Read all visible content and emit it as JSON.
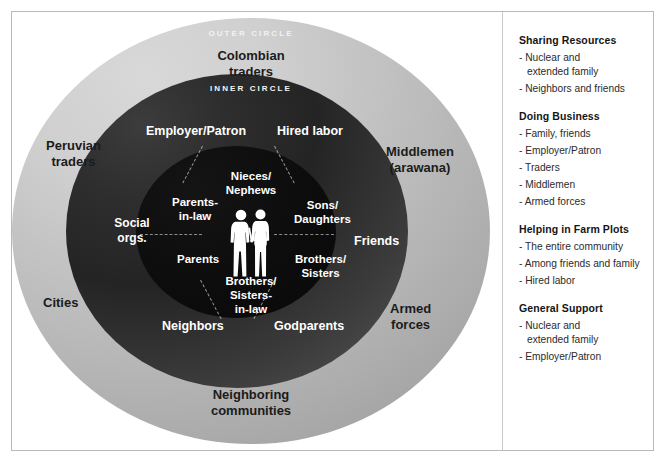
{
  "diagram": {
    "band_captions": {
      "outer": "OUTER CIRCLE",
      "inner": "INNER CIRCLE"
    },
    "outer_ring_labels": [
      {
        "id": "colombian-traders",
        "text": "Colombian\ntraders"
      },
      {
        "id": "peruvian-traders",
        "text": "Peruvian\ntraders"
      },
      {
        "id": "middlemen",
        "text": "Middlemen\n(arawana)"
      },
      {
        "id": "cities",
        "text": "Cities"
      },
      {
        "id": "armed-forces",
        "text": "Armed\nforces"
      },
      {
        "id": "neighboring-communities",
        "text": "Neighboring\ncommunities"
      }
    ],
    "inner_ring_labels": [
      {
        "id": "employer-patron",
        "text": "Employer/Patron"
      },
      {
        "id": "hired-labor",
        "text": "Hired labor"
      },
      {
        "id": "social-orgs",
        "text": "Social\norgs."
      },
      {
        "id": "friends",
        "text": "Friends"
      },
      {
        "id": "neighbors",
        "text": "Neighbors"
      },
      {
        "id": "godparents",
        "text": "Godparents"
      }
    ],
    "core_labels": [
      {
        "id": "nieces-nephews",
        "text": "Nieces/\nNephews"
      },
      {
        "id": "parents-in-law",
        "text": "Parents-\nin-law"
      },
      {
        "id": "sons-daughters",
        "text": "Sons/\nDaughters"
      },
      {
        "id": "parents",
        "text": "Parents"
      },
      {
        "id": "brothers-sisters",
        "text": "Brothers/\nSisters"
      },
      {
        "id": "brothers-sisters-in-law",
        "text": "Brothers/\nSisters-\nin-law"
      }
    ],
    "center_icon": "couple-silhouette-icon",
    "colors": {
      "outer_ring_light": "#d8d8d8",
      "outer_ring_dark": "#848484",
      "inner_ring_dark": "#242424",
      "inner_ring_light": "#7a7a7a",
      "core": "#0c0c0c",
      "label_dark": "#1b1b1b",
      "label_light": "#ffffff"
    }
  },
  "legend": {
    "groups": [
      {
        "title": "Sharing Resources",
        "items": [
          "- Nuclear and\n   extended family",
          "- Neighbors and friends"
        ]
      },
      {
        "title": "Doing Business",
        "items": [
          "- Family, friends",
          "- Employer/Patron",
          "- Traders",
          "- Middlemen",
          "- Armed forces"
        ]
      },
      {
        "title": "Helping in Farm Plots",
        "items": [
          "- The entire community",
          "- Among friends and family",
          "- Hired labor"
        ]
      },
      {
        "title": "General Support",
        "items": [
          "- Nuclear and\n   extended family",
          "- Employer/Patron"
        ]
      }
    ]
  }
}
